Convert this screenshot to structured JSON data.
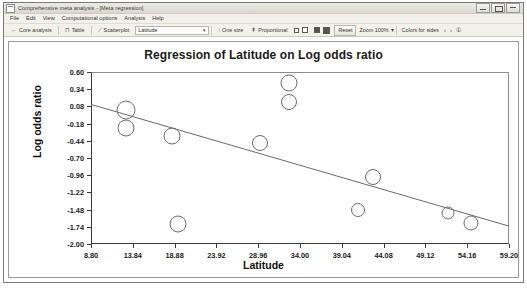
{
  "window": {
    "title": "Comprehensive meta analysis - [Meta regression]",
    "icon": "app-window-icon",
    "buttons": [
      {
        "name": "minimize",
        "glyph": "–"
      },
      {
        "name": "maximize",
        "glyph": "□"
      },
      {
        "name": "close",
        "glyph": "×"
      }
    ]
  },
  "menu": {
    "items": [
      {
        "label": "File"
      },
      {
        "label": "Edit"
      },
      {
        "label": "View"
      },
      {
        "label": "Computational options"
      },
      {
        "label": "Analysis"
      },
      {
        "label": "Help"
      }
    ]
  },
  "toolbar": {
    "core_analysis": "Core analysis",
    "core_analysis_icon": "back-arrow-icon",
    "table": "Table",
    "table_icon": "table-icon",
    "scatterplot": "Scatterplot",
    "scatterplot_icon": "scatterplot-icon",
    "moderator_value": "Latitude",
    "moderator_caret": "▾",
    "one_size": "One size",
    "one_size_icon": "one-size-icon",
    "proportional": "Proportional",
    "proportional_icon": "proportional-icon",
    "reset": "Reset",
    "zoom": "Zoom 100%",
    "zoom_caret": "▾",
    "colors_for_sides": "Colors for sides",
    "prev_glyph": "‹",
    "next_glyph": "›",
    "info_glyph": "①"
  },
  "chart_data": {
    "type": "scatter",
    "title": "Regression of Latitude on Log odds ratio",
    "xlabel": "Latitude",
    "ylabel": "Log odds ratio",
    "xlim": [
      8.8,
      59.2
    ],
    "ylim": [
      -2.0,
      0.6
    ],
    "xticks": [
      "8.80",
      "13.84",
      "18.88",
      "23.92",
      "28.96",
      "34.00",
      "39.04",
      "44.08",
      "49.12",
      "54.16",
      "59.20"
    ],
    "xtick_values": [
      8.8,
      13.84,
      18.88,
      23.92,
      28.96,
      34.0,
      39.04,
      44.08,
      49.12,
      54.16,
      59.2
    ],
    "yticks": [
      "0.60",
      "0.34",
      "0.08",
      "-0.18",
      "-0.44",
      "-0.70",
      "-0.96",
      "-1.22",
      "-1.48",
      "-1.74",
      "-2.00"
    ],
    "ytick_values": [
      0.6,
      0.34,
      0.08,
      -0.18,
      -0.44,
      -0.7,
      -0.96,
      -1.22,
      -1.48,
      -1.74,
      -2.0
    ],
    "grid": false,
    "legend": null,
    "marker": {
      "shape": "circle",
      "fill": "none",
      "edge_color": "#6e6e6e"
    },
    "points": [
      {
        "x": 13.0,
        "y": 0.02,
        "r": 9.5
      },
      {
        "x": 13.0,
        "y": -0.25,
        "r": 8.5
      },
      {
        "x": 18.6,
        "y": -0.36,
        "r": 8.5
      },
      {
        "x": 19.3,
        "y": -1.7,
        "r": 8.5
      },
      {
        "x": 29.2,
        "y": -0.47,
        "r": 8.0
      },
      {
        "x": 32.7,
        "y": 0.44,
        "r": 8.5
      },
      {
        "x": 32.7,
        "y": 0.15,
        "r": 8.0
      },
      {
        "x": 41.0,
        "y": -1.48,
        "r": 7.0
      },
      {
        "x": 42.8,
        "y": -0.99,
        "r": 8.0
      },
      {
        "x": 51.9,
        "y": -1.53,
        "r": 6.5
      },
      {
        "x": 54.6,
        "y": -1.68,
        "r": 7.5
      }
    ],
    "regression_line": {
      "x1": 8.8,
      "y1": 0.11,
      "x2": 59.2,
      "y2": -1.73,
      "color": "#6a6a6a"
    }
  }
}
